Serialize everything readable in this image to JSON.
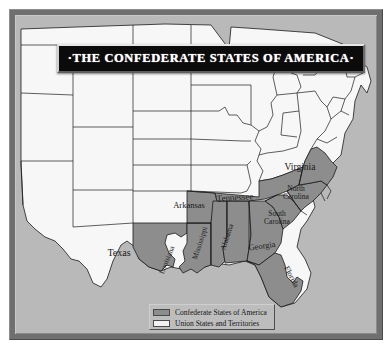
{
  "title": {
    "banner_text": "·THE CONFEDERATE STATES OF AMERICA·"
  },
  "legend": {
    "items": [
      {
        "label": "Confederate States of America",
        "color": "#8d8d8d",
        "swatch": "confederate-swatch"
      },
      {
        "label": "Union States and Territories",
        "color": "#f2f2f2",
        "swatch": "union-swatch"
      }
    ]
  },
  "colors": {
    "confederate_fill": "#8d8d8d",
    "union_fill": "#f7f7f7",
    "ocean_background": "#b9b9b9",
    "frame": "#6f6f6f",
    "banner_background": "#0b0b0b",
    "banner_text": "#ffffff",
    "outline": "#1a1a1a",
    "page_margin": "#ffffff"
  },
  "map": {
    "confederate_states": [
      {
        "name": "Texas",
        "label": "Texas",
        "x": 104,
        "y": 238,
        "size": 10,
        "rotate": 0
      },
      {
        "name": "Louisiana",
        "label": "Louisiana",
        "x": 152,
        "y": 245,
        "size": 7.5,
        "rotate": -68
      },
      {
        "name": "Arkansas",
        "label": "Arkansas",
        "x": 174,
        "y": 190,
        "size": 8.5,
        "rotate": 0
      },
      {
        "name": "Mississippi",
        "label": "Mississippi",
        "x": 185,
        "y": 228,
        "size": 7.5,
        "rotate": -72
      },
      {
        "name": "Alabama",
        "label": "Alabama",
        "x": 212,
        "y": 222,
        "size": 7.5,
        "rotate": -72
      },
      {
        "name": "Tennessee",
        "label": "Tennessee",
        "x": 220,
        "y": 183,
        "size": 9,
        "rotate": -4
      },
      {
        "name": "Georgia",
        "label": "Georgia",
        "x": 247,
        "y": 231,
        "size": 8.5,
        "rotate": -8
      },
      {
        "name": "Florida",
        "label": "Florida",
        "x": 276,
        "y": 262,
        "size": 8,
        "rotate": 62
      },
      {
        "name": "South Carolina",
        "label": "South\nCarolina",
        "x": 262,
        "y": 203,
        "size": 7.5,
        "rotate": 0
      },
      {
        "name": "North Carolina",
        "label": "North\nCarolina",
        "x": 281,
        "y": 178,
        "size": 7.5,
        "rotate": 0
      },
      {
        "name": "Virginia",
        "label": "Virginia",
        "x": 285,
        "y": 153,
        "size": 9.5,
        "rotate": 0
      }
    ]
  }
}
